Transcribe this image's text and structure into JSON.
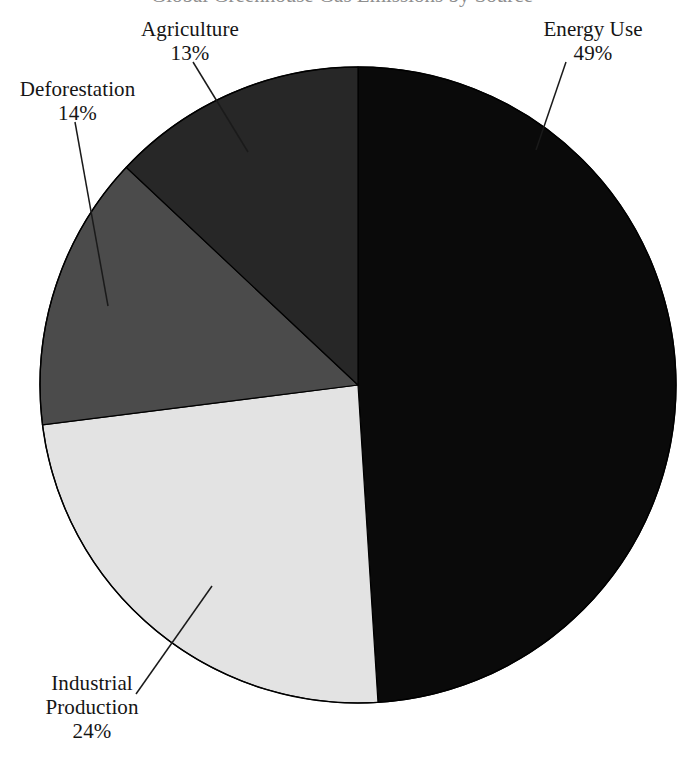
{
  "figure": {
    "background_color": "#ffffff",
    "clipped_title_text": "Global Greenhouse Gas Emissions by Source",
    "outline_color": "#000000",
    "label_text_color": "#151515",
    "leader_line_color": "#1a1a1a"
  },
  "labels": {
    "agriculture": {
      "name": "Agriculture",
      "percent": "13%"
    },
    "deforestation": {
      "name": "Deforestation",
      "percent": "14%"
    },
    "energy": {
      "name": "Energy Use",
      "percent": "49%"
    },
    "industrial": {
      "name": "Industrial",
      "name2": "Production",
      "percent": "24%"
    }
  },
  "chart_data": {
    "type": "pie",
    "title": "",
    "xlabel": "",
    "ylabel": "",
    "legend_position": "none",
    "grid": false,
    "units": "percent",
    "total": 100,
    "start_angle_deg": 0,
    "direction": "clockwise",
    "center": {
      "x": 358,
      "y": 385
    },
    "radius": 318,
    "categories": [
      "Energy Use",
      "Industrial Production",
      "Deforestation",
      "Agriculture"
    ],
    "values": [
      49,
      24,
      14,
      13
    ],
    "slices": [
      {
        "label": "Energy Use",
        "value": 49,
        "display_value": "49%",
        "color": "#0a0a0a",
        "start_deg": 0.0,
        "end_deg": 176.4,
        "label_position": "top-right"
      },
      {
        "label": "Industrial Production",
        "value": 24,
        "display_value": "24%",
        "color": "#e3e3e3",
        "start_deg": 176.4,
        "end_deg": 262.8,
        "label_position": "bottom-left"
      },
      {
        "label": "Deforestation",
        "value": 14,
        "display_value": "14%",
        "color": "#4b4b4b",
        "start_deg": 262.8,
        "end_deg": 313.2,
        "label_position": "left"
      },
      {
        "label": "Agriculture",
        "value": 13,
        "display_value": "13%",
        "color": "#272727",
        "start_deg": 313.2,
        "end_deg": 360.0,
        "label_position": "top-left"
      }
    ]
  }
}
